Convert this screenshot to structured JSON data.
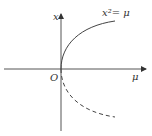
{
  "diagram": {
    "type": "bifurcation-diagram",
    "axes": {
      "horizontal_label": "μ",
      "vertical_label": "x",
      "origin_label": "O"
    },
    "curves": [
      {
        "name": "stable-branch",
        "equation": "x² = μ",
        "label": "x²= μ",
        "style": "solid",
        "branch": "upper"
      },
      {
        "name": "unstable-branch",
        "style": "dashed",
        "branch": "lower"
      }
    ],
    "colors": {
      "line": "#444444",
      "background": "#ffffff"
    }
  }
}
